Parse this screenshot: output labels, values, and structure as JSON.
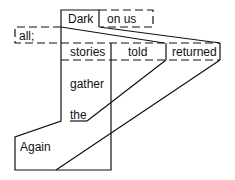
{
  "diagram": {
    "type": "sentence-diagram",
    "colors": {
      "line": "#111111",
      "background": "#ffffff"
    },
    "words": [
      {
        "id": "dark",
        "text": "Dark"
      },
      {
        "id": "on_us",
        "text": "on us"
      },
      {
        "id": "all",
        "text": "all;"
      },
      {
        "id": "stories",
        "text": "stories"
      },
      {
        "id": "told",
        "text": "told"
      },
      {
        "id": "returned",
        "text": "returned"
      },
      {
        "id": "gather",
        "text": "gather"
      },
      {
        "id": "the",
        "text": "the"
      },
      {
        "id": "again",
        "text": "Again"
      }
    ]
  }
}
